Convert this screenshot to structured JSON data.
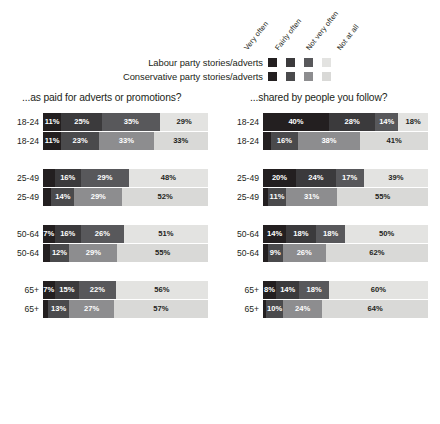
{
  "legend": {
    "column_headers": [
      "Very often",
      "Fairly often",
      "Not very often",
      "Not at all"
    ],
    "rows": [
      {
        "label": "Labour party stories/adverts",
        "colors": [
          "#231f20",
          "#3b3a3c",
          "#58585b",
          "#e3e3e1"
        ]
      },
      {
        "label": "Conservative party stories/adverts",
        "colors": [
          "#231f20",
          "#4a4a4c",
          "#8d8d8f",
          "#d9d9d7"
        ]
      }
    ]
  },
  "panels": [
    {
      "title": "...as paid for adverts or promotions?",
      "groups": [
        {
          "age": "18-24",
          "series": [
            {
              "party": "Labour",
              "values": [
                11,
                25,
                35,
                29
              ],
              "labels": [
                "11%",
                "25%",
                "35%",
                "29%"
              ]
            },
            {
              "party": "Conservative",
              "values": [
                11,
                23,
                33,
                33
              ],
              "labels": [
                "11%",
                "23%",
                "33%",
                "33%"
              ]
            }
          ]
        },
        {
          "age": "25-49",
          "series": [
            {
              "party": "Labour",
              "values": [
                7,
                16,
                29,
                48
              ],
              "labels": [
                "",
                "16%",
                "29%",
                "48%"
              ]
            },
            {
              "party": "Conservative",
              "values": [
                5,
                14,
                29,
                52
              ],
              "labels": [
                "",
                "14%",
                "29%",
                "52%"
              ]
            }
          ]
        },
        {
          "age": "50-64",
          "series": [
            {
              "party": "Labour",
              "values": [
                7,
                16,
                26,
                51
              ],
              "labels": [
                "7%",
                "16%",
                "26%",
                "51%"
              ]
            },
            {
              "party": "Conservative",
              "values": [
                4,
                12,
                29,
                55
              ],
              "labels": [
                "",
                "12%",
                "29%",
                "55%"
              ]
            }
          ]
        },
        {
          "age": "65+",
          "series": [
            {
              "party": "Labour",
              "values": [
                7,
                15,
                22,
                56
              ],
              "labels": [
                "7%",
                "15%",
                "22%",
                "56%"
              ]
            },
            {
              "party": "Conservative",
              "values": [
                3,
                13,
                27,
                57
              ],
              "labels": [
                "",
                "13%",
                "27%",
                "57%"
              ]
            }
          ]
        }
      ]
    },
    {
      "title": "...shared by people you follow?",
      "groups": [
        {
          "age": "18-24",
          "series": [
            {
              "party": "Labour",
              "values": [
                40,
                28,
                14,
                18
              ],
              "labels": [
                "40%",
                "28%",
                "14%",
                "18%"
              ]
            },
            {
              "party": "Conservative",
              "values": [
                5,
                16,
                38,
                41
              ],
              "labels": [
                "",
                "16%",
                "38%",
                "41%"
              ]
            }
          ]
        },
        {
          "age": "25-49",
          "series": [
            {
              "party": "Labour",
              "values": [
                20,
                24,
                17,
                39
              ],
              "labels": [
                "20%",
                "24%",
                "17%",
                "39%"
              ]
            },
            {
              "party": "Conservative",
              "values": [
                3,
                11,
                31,
                55
              ],
              "labels": [
                "",
                "11%",
                "31%",
                "55%"
              ]
            }
          ]
        },
        {
          "age": "50-64",
          "series": [
            {
              "party": "Labour",
              "values": [
                14,
                18,
                18,
                50
              ],
              "labels": [
                "14%",
                "18%",
                "18%",
                "50%"
              ]
            },
            {
              "party": "Conservative",
              "values": [
                3,
                9,
                26,
                62
              ],
              "labels": [
                "",
                "9%",
                "26%",
                "62%"
              ]
            }
          ]
        },
        {
          "age": "65+",
          "series": [
            {
              "party": "Labour",
              "values": [
                8,
                14,
                18,
                60
              ],
              "labels": [
                "8%",
                "14%",
                "18%",
                "60%"
              ]
            },
            {
              "party": "Conservative",
              "values": [
                2,
                10,
                24,
                64
              ],
              "labels": [
                "",
                "10%",
                "24%",
                "64%"
              ]
            }
          ]
        }
      ]
    }
  ],
  "chart_data": {
    "type": "bar",
    "title": "",
    "subtitle": "",
    "orientation": "horizontal",
    "stacked": true,
    "stack_total": 100,
    "unit": "percent",
    "xlabel": "",
    "ylabel": "",
    "xlim": [
      0,
      100
    ],
    "grid": false,
    "legend_position": "top",
    "categories": [
      "Very often",
      "Fairly often",
      "Not very often",
      "Not at all"
    ],
    "group_categories": [
      "18-24",
      "25-49",
      "50-64",
      "65+"
    ],
    "party_series": [
      "Labour party stories/adverts",
      "Conservative party stories/adverts"
    ],
    "panels": [
      {
        "panel_title": "...as paid for adverts or promotions?",
        "series": [
          {
            "name": "Labour 18-24",
            "age": "18-24",
            "party": "Labour",
            "values": [
              11,
              25,
              35,
              29
            ]
          },
          {
            "name": "Conservative 18-24",
            "age": "18-24",
            "party": "Conservative",
            "values": [
              11,
              23,
              33,
              33
            ]
          },
          {
            "name": "Labour 25-49",
            "age": "25-49",
            "party": "Labour",
            "values": [
              7,
              16,
              29,
              48
            ]
          },
          {
            "name": "Conservative 25-49",
            "age": "25-49",
            "party": "Conservative",
            "values": [
              5,
              14,
              29,
              52
            ]
          },
          {
            "name": "Labour 50-64",
            "age": "50-64",
            "party": "Labour",
            "values": [
              7,
              16,
              26,
              51
            ]
          },
          {
            "name": "Conservative 50-64",
            "age": "50-64",
            "party": "Conservative",
            "values": [
              4,
              12,
              29,
              55
            ]
          },
          {
            "name": "Labour 65+",
            "age": "65+",
            "party": "Labour",
            "values": [
              7,
              15,
              22,
              56
            ]
          },
          {
            "name": "Conservative 65+",
            "age": "65+",
            "party": "Conservative",
            "values": [
              3,
              13,
              27,
              57
            ]
          }
        ]
      },
      {
        "panel_title": "...shared by people you follow?",
        "series": [
          {
            "name": "Labour 18-24",
            "age": "18-24",
            "party": "Labour",
            "values": [
              40,
              28,
              14,
              18
            ]
          },
          {
            "name": "Conservative 18-24",
            "age": "18-24",
            "party": "Conservative",
            "values": [
              5,
              16,
              38,
              41
            ]
          },
          {
            "name": "Labour 25-49",
            "age": "25-49",
            "party": "Labour",
            "values": [
              20,
              24,
              17,
              39
            ]
          },
          {
            "name": "Conservative 25-49",
            "age": "25-49",
            "party": "Conservative",
            "values": [
              3,
              11,
              31,
              55
            ]
          },
          {
            "name": "Labour 50-64",
            "age": "50-64",
            "party": "Labour",
            "values": [
              14,
              18,
              18,
              50
            ]
          },
          {
            "name": "Conservative 50-64",
            "age": "50-64",
            "party": "Conservative",
            "values": [
              3,
              9,
              26,
              62
            ]
          },
          {
            "name": "Labour 65+",
            "age": "65+",
            "party": "Labour",
            "values": [
              8,
              14,
              18,
              60
            ]
          },
          {
            "name": "Conservative 65+",
            "age": "65+",
            "party": "Conservative",
            "values": [
              2,
              10,
              24,
              64
            ]
          }
        ]
      }
    ],
    "colors": {
      "labour": [
        "#231f20",
        "#3b3a3c",
        "#58585b",
        "#e3e3e1"
      ],
      "conservative": [
        "#231f20",
        "#4a4a4c",
        "#8d8d8f",
        "#d9d9d7"
      ],
      "background": "#ffffff",
      "text": "#231f20"
    }
  }
}
